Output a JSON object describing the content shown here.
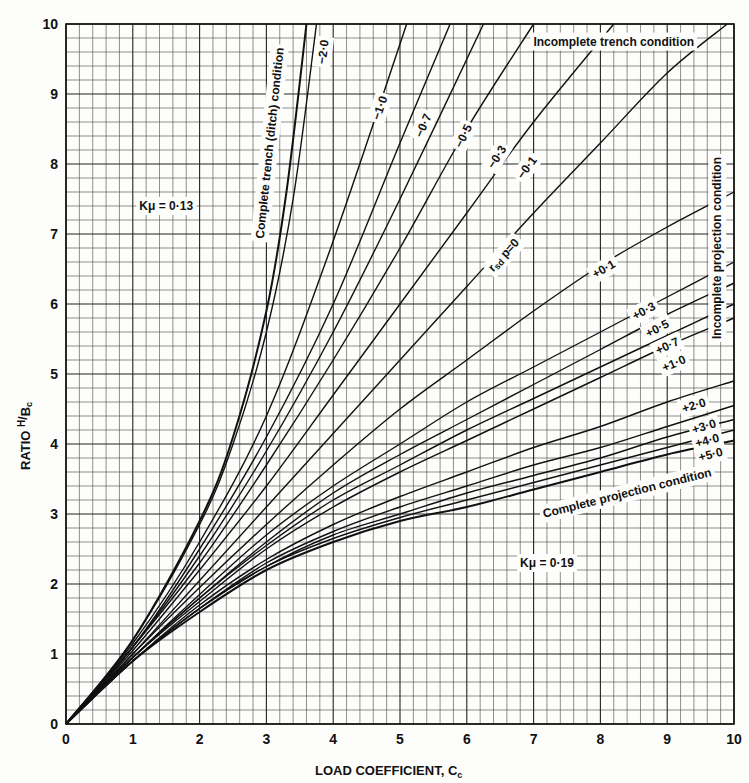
{
  "chart_data": {
    "type": "line",
    "title": "",
    "xlabel": "LOAD COEFFICIENT, Cc",
    "ylabel": "RATIO H/Bc",
    "xlim": [
      0,
      10
    ],
    "ylim": [
      0,
      10
    ],
    "x_ticks": [
      "0",
      "1",
      "2",
      "3",
      "4",
      "5",
      "6",
      "7",
      "8",
      "9",
      "10"
    ],
    "y_ticks": [
      "0",
      "1",
      "2",
      "3",
      "4",
      "5",
      "6",
      "7",
      "8",
      "9",
      "10"
    ],
    "grid": true,
    "grid_minor_divisions": 5,
    "parameter_label": "r_sd p",
    "annotations": [
      {
        "text": "Kμ = 0·13",
        "x": 1.5,
        "y": 7.4
      },
      {
        "text": "Kμ = 0·19",
        "x": 7.2,
        "y": 2.3
      },
      {
        "text": "Incomplete trench condition",
        "x": 8.2,
        "y": 9.75
      },
      {
        "text": "Incomplete projection condition",
        "x": 9.75,
        "y": 6.8,
        "rotation": -90
      },
      {
        "text": "Complete trench (ditch) condition",
        "x": 3.05,
        "y": 8.3,
        "rotation": -84
      },
      {
        "text": "Complete projection condition",
        "x": 8.4,
        "y": 3.3,
        "rotation": -14
      }
    ],
    "series": [
      {
        "name": "Complete trench (ditch) condition",
        "x": [
          0,
          1,
          2,
          2.5,
          3,
          3.3,
          3.6
        ],
        "y": [
          0,
          1.2,
          2.9,
          4.1,
          5.9,
          7.6,
          10
        ]
      },
      {
        "name": "-2.0",
        "x": [
          0,
          1,
          2,
          2.5,
          3,
          3.4,
          3.75
        ],
        "y": [
          0,
          1.2,
          2.85,
          4.0,
          5.6,
          7.5,
          10
        ]
      },
      {
        "name": "-1.0",
        "x": [
          0,
          1,
          2,
          3,
          4,
          5.1
        ],
        "y": [
          0,
          1.15,
          2.6,
          4.4,
          6.9,
          10
        ]
      },
      {
        "name": "-0.7",
        "x": [
          0,
          1,
          2,
          3,
          4,
          5,
          5.75
        ],
        "y": [
          0,
          1.1,
          2.5,
          4.1,
          6.0,
          8.3,
          10
        ]
      },
      {
        "name": "-0.5",
        "x": [
          0,
          1,
          2,
          3,
          4,
          5,
          6.25
        ],
        "y": [
          0,
          1.1,
          2.4,
          3.9,
          5.6,
          7.5,
          10
        ]
      },
      {
        "name": "-0.3",
        "x": [
          0,
          1,
          2,
          3,
          4,
          5,
          6,
          7.0
        ],
        "y": [
          0,
          1.1,
          2.3,
          3.7,
          5.2,
          6.8,
          8.5,
          10
        ]
      },
      {
        "name": "-0.1",
        "x": [
          0,
          1,
          2,
          3,
          4,
          5,
          6,
          7,
          8.2
        ],
        "y": [
          0,
          1.05,
          2.2,
          3.4,
          4.7,
          6.0,
          7.3,
          8.6,
          10
        ]
      },
      {
        "name": "0",
        "x": [
          0,
          1,
          2,
          3,
          4,
          5,
          6,
          7,
          8,
          9,
          9.9
        ],
        "y": [
          0,
          1.0,
          2.05,
          3.1,
          4.15,
          5.2,
          6.25,
          7.3,
          8.3,
          9.3,
          10
        ]
      },
      {
        "name": "+0.1",
        "x": [
          0,
          1,
          2,
          3,
          4,
          5,
          6,
          7,
          8,
          9,
          10
        ],
        "y": [
          0,
          1.0,
          1.95,
          2.85,
          3.7,
          4.5,
          5.2,
          5.9,
          6.55,
          7.1,
          7.6
        ]
      },
      {
        "name": "+0.3",
        "x": [
          0,
          1,
          2,
          3,
          4,
          5,
          6,
          7,
          8,
          9,
          10
        ],
        "y": [
          0,
          0.95,
          1.85,
          2.7,
          3.4,
          4.0,
          4.6,
          5.1,
          5.6,
          6.1,
          6.6
        ]
      },
      {
        "name": "+0.5",
        "x": [
          0,
          1,
          2,
          3,
          4,
          5,
          6,
          7,
          8,
          9,
          10
        ],
        "y": [
          0,
          0.95,
          1.8,
          2.6,
          3.3,
          3.85,
          4.35,
          4.85,
          5.35,
          5.85,
          6.3
        ]
      },
      {
        "name": "+0.7",
        "x": [
          0,
          1,
          2,
          3,
          4,
          5,
          6,
          7,
          8,
          9,
          10
        ],
        "y": [
          0,
          0.95,
          1.8,
          2.55,
          3.2,
          3.7,
          4.2,
          4.65,
          5.1,
          5.55,
          6.0
        ]
      },
      {
        "name": "+1.0",
        "x": [
          0,
          1,
          2,
          3,
          4,
          5,
          6,
          7,
          8,
          9,
          10
        ],
        "y": [
          0,
          0.95,
          1.75,
          2.5,
          3.1,
          3.6,
          4.05,
          4.5,
          4.95,
          5.4,
          5.8
        ]
      },
      {
        "name": "+2.0",
        "x": [
          0,
          1,
          2,
          3,
          4,
          5,
          6,
          7,
          8,
          9,
          10
        ],
        "y": [
          0,
          0.9,
          1.7,
          2.35,
          2.85,
          3.25,
          3.6,
          3.95,
          4.25,
          4.6,
          4.9
        ]
      },
      {
        "name": "+3.0",
        "x": [
          0,
          1,
          2,
          3,
          4,
          5,
          6,
          7,
          8,
          9,
          10
        ],
        "y": [
          0,
          0.9,
          1.65,
          2.3,
          2.75,
          3.1,
          3.4,
          3.7,
          3.95,
          4.25,
          4.55
        ]
      },
      {
        "name": "+4.0",
        "x": [
          0,
          1,
          2,
          3,
          4,
          5,
          6,
          7,
          8,
          9,
          10
        ],
        "y": [
          0,
          0.9,
          1.65,
          2.25,
          2.7,
          3.0,
          3.3,
          3.55,
          3.8,
          4.1,
          4.35
        ]
      },
      {
        "name": "+5.0",
        "x": [
          0,
          1,
          2,
          3,
          4,
          5,
          6,
          7,
          8,
          9,
          10
        ],
        "y": [
          0,
          0.9,
          1.65,
          2.25,
          2.65,
          2.95,
          3.2,
          3.45,
          3.7,
          3.95,
          4.2
        ]
      },
      {
        "name": "Complete projection condition",
        "x": [
          0,
          1,
          2,
          3,
          4,
          5,
          6,
          7,
          8,
          9,
          10
        ],
        "y": [
          0,
          0.9,
          1.6,
          2.2,
          2.6,
          2.9,
          3.1,
          3.35,
          3.6,
          3.85,
          4.05
        ]
      }
    ],
    "curve_labels": [
      {
        "text": "−2·0",
        "series": "-2.0",
        "x": 3.85,
        "y": 9.6
      },
      {
        "text": "−1·0",
        "series": "-1.0",
        "x": 4.7,
        "y": 8.8
      },
      {
        "text": "−0·7",
        "series": "-0.7",
        "x": 5.35,
        "y": 8.55
      },
      {
        "text": "−0·5",
        "series": "-0.5",
        "x": 5.95,
        "y": 8.4
      },
      {
        "text": "−0·3",
        "series": "-0.3",
        "x": 6.45,
        "y": 8.1
      },
      {
        "text": "−0·1",
        "series": "-0.1",
        "x": 6.9,
        "y": 7.95
      },
      {
        "text": "r",
        "series": "0",
        "x": 6.55,
        "y": 6.7
      },
      {
        "text": "+0·1",
        "series": "+0.1",
        "x": 8.05,
        "y": 6.5
      },
      {
        "text": "+0·3",
        "series": "+0.3",
        "x": 8.65,
        "y": 5.9
      },
      {
        "text": "+0·5",
        "series": "+0.5",
        "x": 8.85,
        "y": 5.65
      },
      {
        "text": "+0·7",
        "series": "+0.7",
        "x": 9.0,
        "y": 5.4
      },
      {
        "text": "+1·0",
        "series": "+1.0",
        "x": 9.1,
        "y": 5.15
      },
      {
        "text": "+2·0",
        "series": "+2.0",
        "x": 9.4,
        "y": 4.55
      },
      {
        "text": "+3·0",
        "series": "+3.0",
        "x": 9.55,
        "y": 4.25
      },
      {
        "text": "+4·0",
        "series": "+4.0",
        "x": 9.6,
        "y": 4.05
      },
      {
        "text": "+5·0",
        "series": "+5.0",
        "x": 9.65,
        "y": 3.85
      }
    ]
  },
  "text": {
    "xlabel_main": "LOAD  COEFFICIENT, C",
    "xlabel_sub": "c",
    "ylabel_main": "RATIO ",
    "ylabel_frac_num": "H",
    "ylabel_frac_den": "B",
    "ylabel_sub": "c",
    "rsd_main": "r",
    "rsd_sub": "sd",
    "rsd_rest": " p=0"
  }
}
